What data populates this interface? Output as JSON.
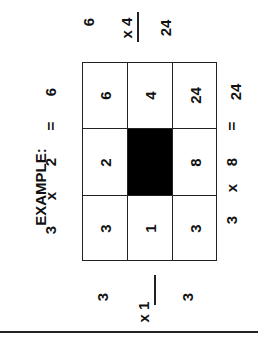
{
  "example_label": "EXAMPLE:",
  "equations": {
    "top": {
      "a": "3",
      "op": "x",
      "b": "2",
      "eq": "=",
      "result": "6"
    },
    "bottom": {
      "a": "3",
      "op": "x",
      "b": "8",
      "eq": "=",
      "result": "24"
    }
  },
  "grid": {
    "rows": [
      [
        "6",
        "4",
        "24"
      ],
      [
        "2",
        "",
        "8"
      ],
      [
        "3",
        "1",
        "3"
      ]
    ],
    "shaded_cell": {
      "row": 1,
      "col": 1
    },
    "shaded_color": "#000000"
  },
  "vertical_problems": {
    "top": {
      "multiplicand": "6",
      "multiplier": "x 4",
      "product": "24"
    },
    "bottom": {
      "multiplicand": "3",
      "multiplier": "x 1",
      "product": "3"
    }
  }
}
